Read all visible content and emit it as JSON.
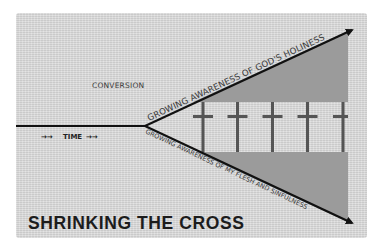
{
  "diagram": {
    "title": "SHRINKING THE CROSS",
    "conversion_label": "CONVERSION",
    "time_label": "TIME",
    "time_arrows_left": "→→",
    "time_arrows_right": "→→",
    "upper_arrow_label": "GROWING AWARENESS OF GOD'S HOLINESS",
    "lower_arrow_label": "GROWING AWARENESS OF MY FLESH AND SINFULNESS",
    "cross_count": 5,
    "icons": {
      "cross": "cross-icon",
      "arrow": "arrow-right-icon"
    },
    "colors": {
      "background": "#d9d9d9",
      "shading": "#9b9b9b",
      "line": "#111111",
      "cross": "#555555",
      "title": "#1c1c1c"
    }
  }
}
